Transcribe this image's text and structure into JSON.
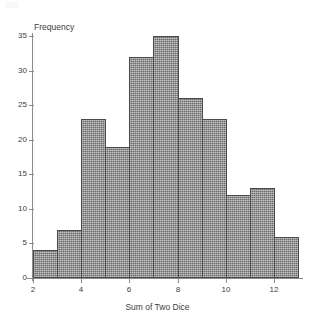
{
  "chart_data": {
    "type": "bar",
    "title": "",
    "xlabel": "Sum of Two Dice",
    "ylabel": "Frequency",
    "categories": [
      2,
      3,
      4,
      5,
      6,
      7,
      8,
      9,
      10,
      11,
      12
    ],
    "values": [
      4,
      7,
      23,
      19,
      32,
      35,
      26,
      23,
      12,
      13,
      6
    ],
    "bins": [
      {
        "left": 2,
        "right": 3,
        "value": 4
      },
      {
        "left": 3,
        "right": 4,
        "value": 7
      },
      {
        "left": 4,
        "right": 5,
        "value": 23
      },
      {
        "left": 5,
        "right": 6,
        "value": 19
      },
      {
        "left": 6,
        "right": 7,
        "value": 32
      },
      {
        "left": 7,
        "right": 8,
        "value": 35
      },
      {
        "left": 8,
        "right": 9,
        "value": 26
      },
      {
        "left": 9,
        "right": 10,
        "value": 23
      },
      {
        "left": 10,
        "right": 11,
        "value": 12
      },
      {
        "left": 11,
        "right": 12,
        "value": 13
      },
      {
        "left": 12,
        "right": 13,
        "value": 6
      }
    ],
    "xlim": [
      2,
      13
    ],
    "ylim": [
      0,
      35
    ],
    "x_ticks": [
      2,
      4,
      6,
      8,
      10,
      12
    ],
    "y_ticks": [
      0,
      5,
      10,
      15,
      20,
      25,
      30,
      35
    ],
    "grid": false,
    "legend": null,
    "bar_fill_color": "#8a8a8a",
    "bar_border_color": "#4a4a4a",
    "axis_color": "#8c8c8c",
    "text_color": "#3d3d3d"
  }
}
